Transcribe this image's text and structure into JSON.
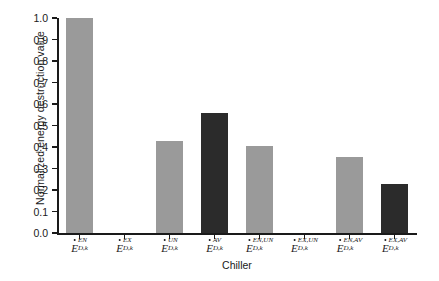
{
  "chart_data": {
    "type": "bar",
    "title": "",
    "xlabel": "Chiller",
    "ylabel": "Normalized energy destruction value",
    "ylim": [
      0.0,
      1.0
    ],
    "ytick_labels": [
      "0.0",
      "0.1",
      "0.2",
      "0.3",
      "0.4",
      "0.5",
      "0.6",
      "0.7",
      "0.8",
      "0.9",
      "1.0"
    ],
    "ytick_values": [
      0.0,
      0.1,
      0.2,
      0.3,
      0.4,
      0.5,
      0.6,
      0.7,
      0.8,
      0.9,
      1.0
    ],
    "grid": false,
    "legend": "none",
    "categories": [
      "E_D,k^EN",
      "E_D,k^EX",
      "E_D,k^UN",
      "E_D,k^AV",
      "E_D,k^EN,UN",
      "E_D,k^EX,UN",
      "E_D,k^EN,AV",
      "E_D,k^EX,AV"
    ],
    "values": [
      1.0,
      0.0,
      0.43,
      0.56,
      0.405,
      0.0,
      0.355,
      0.23
    ],
    "bar_colors": [
      "gray",
      "none",
      "gray",
      "dark",
      "gray",
      "none",
      "gray",
      "dark"
    ],
    "colors": {
      "gray": "#9a9a9a",
      "dark": "#2b2b2b",
      "axis": "#1a1a1a",
      "background": "#ffffff"
    },
    "tick_labels_detail": [
      {
        "base": "E",
        "sup": "EN",
        "sub": "D,k"
      },
      {
        "base": "E",
        "sup": "EX",
        "sub": "D,k"
      },
      {
        "base": "E",
        "sup": "UN",
        "sub": "D,k"
      },
      {
        "base": "E",
        "sup": "AV",
        "sub": "D,k"
      },
      {
        "base": "E",
        "sup": "EN,UN",
        "sub": "D,k"
      },
      {
        "base": "E",
        "sup": "EX,UN",
        "sub": "D,k"
      },
      {
        "base": "E",
        "sup": "EN,AV",
        "sub": "D,k"
      },
      {
        "base": "E",
        "sup": "EX,AV",
        "sub": "D,k"
      }
    ]
  }
}
